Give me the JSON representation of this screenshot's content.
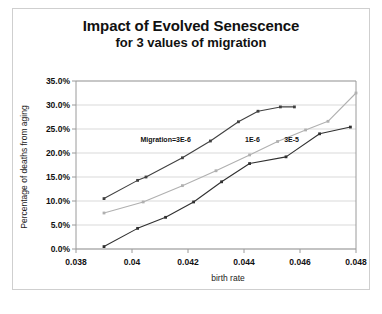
{
  "chart_title": "Impact of Evolved Senescence",
  "chart_subtitle": "for 3 values of migration",
  "axes": {
    "x_label": "birth rate",
    "y_label": "Percentage of deaths from aging",
    "x_ticks": [
      "0.038",
      "0.04",
      "0.042",
      "0.044",
      "0.046",
      "0.048"
    ],
    "y_ticks": [
      "0.0%",
      "5.0%",
      "10.0%",
      "15.0%",
      "20.0%",
      "25.0%",
      "30.0%",
      "35.0%"
    ]
  },
  "annotations": [
    {
      "text": "Migration=3E-6",
      "x": 0.0412,
      "y": 0.222
    },
    {
      "text": "1E-6",
      "x": 0.0443,
      "y": 0.222
    },
    {
      "text": "3E-5",
      "x": 0.0457,
      "y": 0.222
    }
  ],
  "chart_data": {
    "type": "line",
    "title": "Impact of Evolved Senescence for 3 values of migration",
    "xlabel": "birth rate",
    "ylabel": "Percentage of deaths from aging",
    "xlim": [
      0.038,
      0.048
    ],
    "ylim": [
      0.0,
      0.35
    ],
    "ytick_values": [
      0.0,
      0.05,
      0.1,
      0.15,
      0.2,
      0.25,
      0.3,
      0.35
    ],
    "xtick_values": [
      0.038,
      0.04,
      0.042,
      0.044,
      0.046,
      0.048
    ],
    "grid": "horizontal",
    "legend": "inline-annotations",
    "series": [
      {
        "name": "Migration=3E-6",
        "color": "#404040",
        "marker": "square",
        "points": [
          {
            "x": 0.039,
            "y": 0.105
          },
          {
            "x": 0.0402,
            "y": 0.143
          },
          {
            "x": 0.0405,
            "y": 0.15
          },
          {
            "x": 0.0418,
            "y": 0.19
          },
          {
            "x": 0.0428,
            "y": 0.225
          },
          {
            "x": 0.0438,
            "y": 0.265
          },
          {
            "x": 0.0445,
            "y": 0.287
          },
          {
            "x": 0.0453,
            "y": 0.296
          },
          {
            "x": 0.0458,
            "y": 0.296
          }
        ]
      },
      {
        "name": "1E-6",
        "color": "#b0b0b0",
        "marker": "square",
        "points": [
          {
            "x": 0.039,
            "y": 0.075
          },
          {
            "x": 0.0404,
            "y": 0.098
          },
          {
            "x": 0.0418,
            "y": 0.132
          },
          {
            "x": 0.043,
            "y": 0.163
          },
          {
            "x": 0.0442,
            "y": 0.196
          },
          {
            "x": 0.0452,
            "y": 0.224
          },
          {
            "x": 0.0462,
            "y": 0.248
          },
          {
            "x": 0.047,
            "y": 0.266
          },
          {
            "x": 0.048,
            "y": 0.325
          }
        ]
      },
      {
        "name": "3E-5",
        "color": "#303030",
        "marker": "square",
        "points": [
          {
            "x": 0.039,
            "y": 0.005
          },
          {
            "x": 0.0402,
            "y": 0.043
          },
          {
            "x": 0.0412,
            "y": 0.066
          },
          {
            "x": 0.0422,
            "y": 0.098
          },
          {
            "x": 0.0432,
            "y": 0.14
          },
          {
            "x": 0.0442,
            "y": 0.178
          },
          {
            "x": 0.0455,
            "y": 0.192
          },
          {
            "x": 0.0467,
            "y": 0.24
          },
          {
            "x": 0.0478,
            "y": 0.254
          }
        ]
      }
    ]
  }
}
